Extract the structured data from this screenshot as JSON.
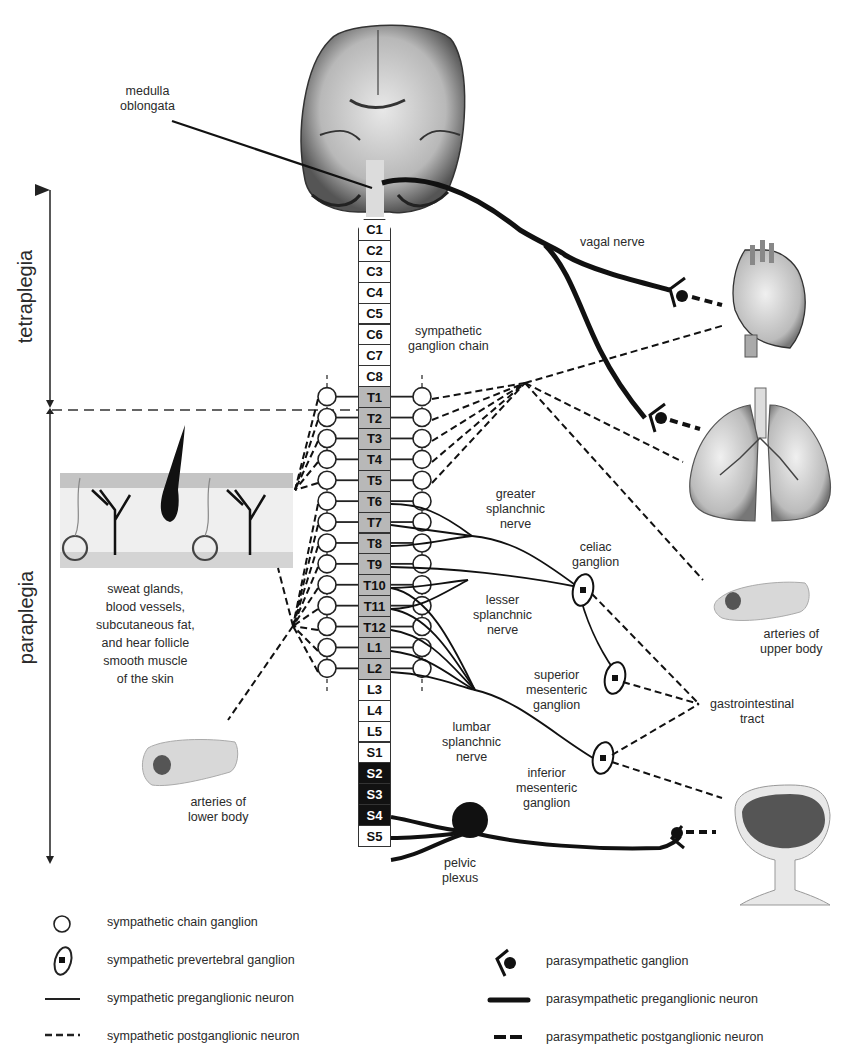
{
  "diagram": {
    "labels": {
      "medulla": "medulla\noblongata",
      "vagal_nerve": "vagal nerve",
      "sympathetic_chain": "sympathetic\nganglion chain",
      "greater_splanchnic": "greater\nsplanchnic\nnerve",
      "lesser_splanchnic": "lesser\nsplanchnic\nnerve",
      "lumbar_splanchnic": "lumbar\nsplanchnic\nnerve",
      "celiac_ganglion": "celiac\nganglion",
      "superior_mesenteric": "superior\nmesenteric\nganglion",
      "inferior_mesenteric": "inferior\nmesenteric\nganglion",
      "pelvic_plexus": "pelvic\nplexus",
      "gastrointestinal": "gastrointestinal\ntract",
      "arteries_upper": "arteries of\nupper body",
      "arteries_lower": "arteries of\nlower body",
      "skin_targets": "sweat glands,\nblood vessels,\nsubcutaneous fat,\nand hear follicle\nsmooth muscle\nof the skin"
    },
    "injury_levels": {
      "tetraplegia": "tetraplegia",
      "paraplegia": "paraplegia"
    },
    "spinal_segments": [
      {
        "name": "C1",
        "type": "cervical"
      },
      {
        "name": "C2",
        "type": "cervical"
      },
      {
        "name": "C3",
        "type": "cervical"
      },
      {
        "name": "C4",
        "type": "cervical"
      },
      {
        "name": "C5",
        "type": "cervical"
      },
      {
        "name": "C6",
        "type": "cervical"
      },
      {
        "name": "C7",
        "type": "cervical"
      },
      {
        "name": "C8",
        "type": "cervical"
      },
      {
        "name": "T1",
        "type": "sympathetic"
      },
      {
        "name": "T2",
        "type": "sympathetic"
      },
      {
        "name": "T3",
        "type": "sympathetic"
      },
      {
        "name": "T4",
        "type": "sympathetic"
      },
      {
        "name": "T5",
        "type": "sympathetic"
      },
      {
        "name": "T6",
        "type": "sympathetic"
      },
      {
        "name": "T7",
        "type": "sympathetic"
      },
      {
        "name": "T8",
        "type": "sympathetic"
      },
      {
        "name": "T9",
        "type": "sympathetic"
      },
      {
        "name": "T10",
        "type": "sympathetic"
      },
      {
        "name": "T11",
        "type": "sympathetic"
      },
      {
        "name": "T12",
        "type": "sympathetic"
      },
      {
        "name": "L1",
        "type": "sympathetic"
      },
      {
        "name": "L2",
        "type": "sympathetic"
      },
      {
        "name": "L3",
        "type": "plain"
      },
      {
        "name": "L4",
        "type": "plain"
      },
      {
        "name": "L5",
        "type": "plain"
      },
      {
        "name": "S1",
        "type": "plain"
      },
      {
        "name": "S2",
        "type": "parasympathetic"
      },
      {
        "name": "S3",
        "type": "parasympathetic"
      },
      {
        "name": "S4",
        "type": "parasympathetic"
      },
      {
        "name": "S5",
        "type": "plain"
      }
    ],
    "organs": [
      "brain",
      "heart",
      "lungs",
      "skin",
      "arteries-upper",
      "arteries-lower",
      "bladder"
    ],
    "colors": {
      "line": "#111111",
      "sympathetic_segment": "#b8b8b8",
      "parasympathetic_segment": "#111111",
      "skin_layer": "#c8c8c8"
    }
  },
  "legend": {
    "left": [
      {
        "symbol": "open-circle",
        "label": "sympathetic chain ganglion"
      },
      {
        "symbol": "ellipse-with-dot",
        "label": "sympathetic prevertebral ganglion"
      },
      {
        "symbol": "thin-solid-line",
        "label": "sympathetic preganglionic neuron"
      },
      {
        "symbol": "thin-dashed-line",
        "label": "sympathetic postganglionic neuron"
      }
    ],
    "right": [
      {
        "symbol": "fork-with-dot",
        "label": "parasympathetic ganglion"
      },
      {
        "symbol": "thick-solid-line",
        "label": "parasympathetic preganglionic neuron"
      },
      {
        "symbol": "thick-dashed-line",
        "label": "parasympathetic postganglionic neuron"
      }
    ]
  }
}
